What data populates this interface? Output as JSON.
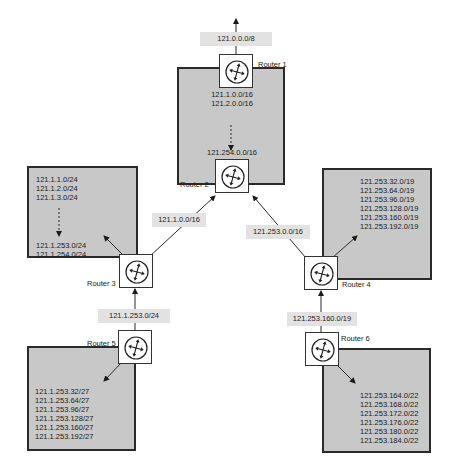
{
  "routers": [
    {
      "id": "router-1",
      "name": "Router 1"
    },
    {
      "id": "router-2",
      "name": "Router 2"
    },
    {
      "id": "router-3",
      "name": "Router 3"
    },
    {
      "id": "router-4",
      "name": "Router 4"
    },
    {
      "id": "router-5",
      "name": "Router 5"
    },
    {
      "id": "router-6",
      "name": "Router 6"
    }
  ],
  "advertisements": {
    "router1_up": "121.0.0.0/8",
    "router3_to_router2": "121.1.0.0/16",
    "router4_to_router2": "121.253.0.0/16",
    "router5_to_router3": "121.1.253.0/24",
    "router6_to_router4": "121.253.160.0/19"
  },
  "networks": {
    "top": {
      "first": [
        "121.1.0.0/16",
        "121.2.0.0/16"
      ],
      "last": [
        "121.254.0.0/16"
      ]
    },
    "left": {
      "first": [
        "121.1.1.0/24",
        "121.1.2.0/24",
        "121.1.3.0/24"
      ],
      "last": [
        "121.1.253.0/24",
        "121.1.254.0/24"
      ]
    },
    "right": {
      "list": [
        "121.253.32.0/19",
        "121.253.64.0/19",
        "121.253.96.0/19",
        "121.253.128.0/19",
        "121.253.160.0/19",
        "121.253.192.0/19"
      ]
    },
    "bottom_left": {
      "list": [
        "121.1.253.32/27",
        "121.1.253.64/27",
        "121.1.253.96/27",
        "121.1.253.128/27",
        "121.1.253.160/27",
        "121.1.253.192/27"
      ]
    },
    "bottom_right": {
      "list": [
        "121.253.164.0/22",
        "121.253.168.0/22",
        "121.253.172.0/22",
        "121.253.176.0/22",
        "121.253.180.0/22",
        "121.253.184.0/22"
      ]
    }
  },
  "colors": {
    "network_fill": "#c8c8c8",
    "label_fill": "#e2e2e2",
    "line": "#2a2a2a"
  }
}
